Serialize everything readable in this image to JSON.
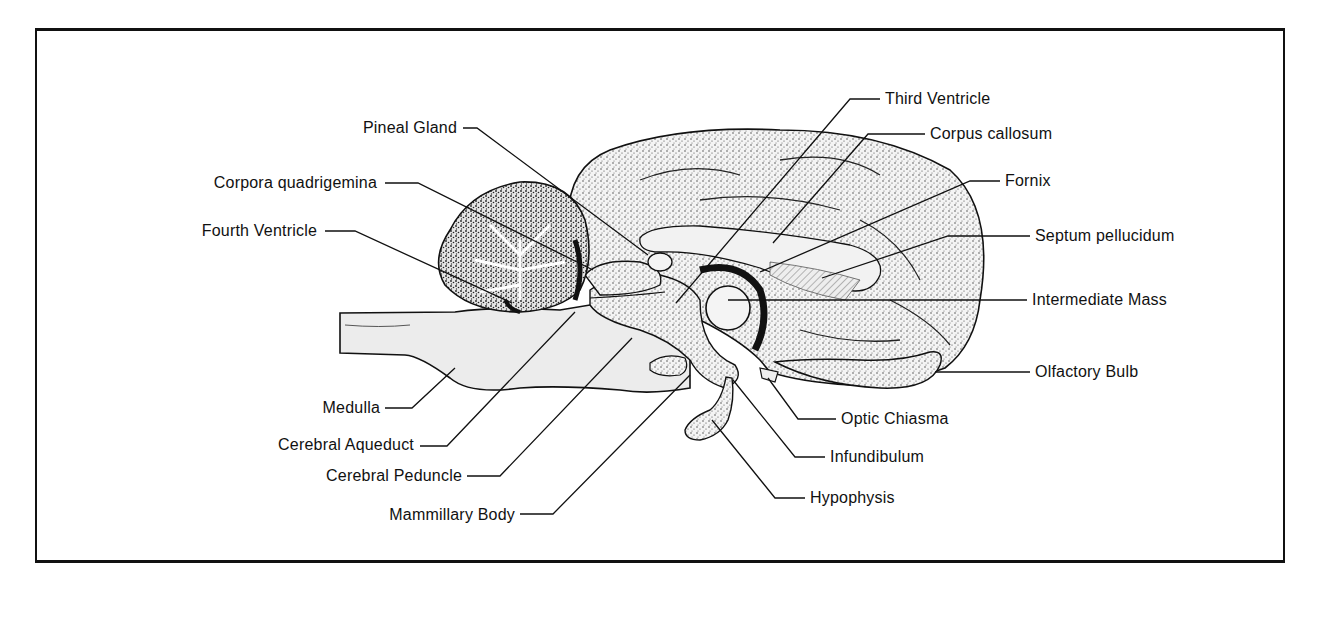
{
  "figure": {
    "frame_color": "#111111"
  },
  "labels": {
    "third_ventricle": "Third Ventricle",
    "corpus_callosum": "Corpus callosum",
    "pineal_gland": "Pineal Gland",
    "fornix": "Fornix",
    "corpora_quadrigemina": "Corpora quadrigemina",
    "fourth_ventricle": "Fourth Ventricle",
    "septum_pellucidum": "Septum pellucidum",
    "intermediate_mass": "Intermediate Mass",
    "olfactory_bulb": "Olfactory Bulb",
    "medulla": "Medulla",
    "optic_chiasma": "Optic Chiasma",
    "cerebral_aqueduct": "Cerebral Aqueduct",
    "infundibulum": "Infundibulum",
    "cerebral_peduncle": "Cerebral Peduncle",
    "hypophysis": "Hypophysis",
    "mammillary_body": "Mammillary Body"
  }
}
